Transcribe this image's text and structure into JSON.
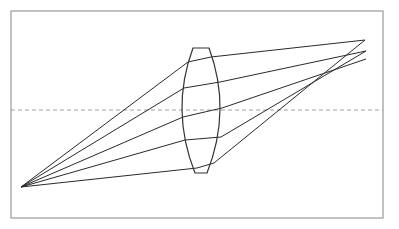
{
  "diagram": {
    "type": "optics-ray-diagram",
    "frame": {
      "x": 11,
      "y": 11,
      "width": 372,
      "height": 207,
      "stroke": "#9a9a9a"
    },
    "optical_axis": {
      "y": 110,
      "x1": 11,
      "x2": 383,
      "stroke": "#8a8a8a",
      "dash": "4,3"
    },
    "source_point": {
      "x": 21,
      "y": 187
    },
    "lens": {
      "top_flat": {
        "x1": 193,
        "x2": 209,
        "y": 48
      },
      "bottom_flat": {
        "x1": 195,
        "x2": 207,
        "y": 173
      },
      "left_vertex": {
        "x": 182,
        "y": 110
      },
      "right_vertex": {
        "x": 220,
        "y": 110
      },
      "stroke": "#333333"
    },
    "image_points": [
      {
        "x": 365,
        "y": 40
      },
      {
        "x": 366,
        "y": 51
      },
      {
        "x": 366,
        "y": 59
      }
    ],
    "rays": [
      {
        "points": [
          [
            21,
            187
          ],
          [
            188,
            62
          ],
          [
            211,
            57
          ],
          [
            365,
            40
          ]
        ]
      },
      {
        "points": [
          [
            21,
            187
          ],
          [
            184,
            88
          ],
          [
            220,
            82
          ],
          [
            366,
            51
          ]
        ]
      },
      {
        "points": [
          [
            21,
            187
          ],
          [
            183,
            117
          ],
          [
            222,
            108
          ],
          [
            366,
            59
          ]
        ]
      },
      {
        "points": [
          [
            21,
            187
          ],
          [
            185,
            140
          ],
          [
            221,
            137
          ],
          [
            366,
            51
          ]
        ]
      },
      {
        "points": [
          [
            21,
            187
          ],
          [
            197,
            168
          ],
          [
            214,
            163
          ],
          [
            365,
            40
          ]
        ]
      }
    ],
    "ray_color": "#2a2a2a"
  }
}
